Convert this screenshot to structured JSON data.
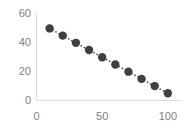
{
  "chart_data": {
    "type": "scatter",
    "title": "",
    "subtitle": "",
    "xlabel": "",
    "ylabel": "",
    "x": [
      10,
      20,
      30,
      40,
      50,
      60,
      70,
      80,
      90,
      100
    ],
    "values": [
      50,
      45,
      40,
      35,
      30,
      25,
      20,
      15,
      10,
      5
    ],
    "series": [
      {
        "name": "",
        "x": [
          10,
          20,
          30,
          40,
          50,
          60,
          70,
          80,
          90,
          100
        ],
        "values": [
          50,
          45,
          40,
          35,
          30,
          25,
          20,
          15,
          10,
          5
        ],
        "marker": "circle",
        "marker_color": "#3f3f3f",
        "trendline": "dotted",
        "trendline_color": "#3f3f3f"
      }
    ],
    "xlim": [
      0,
      110
    ],
    "ylim": [
      0,
      60
    ],
    "xticks": [
      0,
      50,
      100
    ],
    "yticks": [
      0,
      20,
      40,
      60
    ],
    "xtick_labels": [
      "0",
      "50",
      "100"
    ],
    "ytick_labels": [
      "0",
      "20",
      "40",
      "60"
    ],
    "grid": false,
    "legend": false,
    "legend_position": "none",
    "axis_color": "#d9d9d9",
    "tick_label_color": "#808080",
    "background_color": "#ffffff",
    "annotations": []
  }
}
